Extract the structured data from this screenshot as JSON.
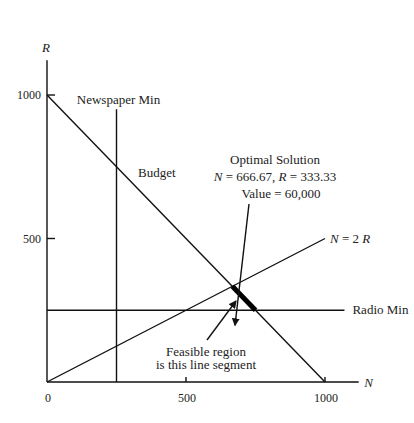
{
  "chart_data": {
    "type": "line",
    "title": "",
    "xlabel": "N",
    "ylabel": "R",
    "xlim": [
      0,
      1150
    ],
    "ylim": [
      0,
      1150
    ],
    "x_ticks": [
      0,
      500,
      1000
    ],
    "x_tick_labels": [
      "0",
      "500",
      "1000"
    ],
    "y_ticks": [
      500,
      1000
    ],
    "y_tick_labels": [
      "500",
      "1000"
    ],
    "grid": false,
    "lines": [
      {
        "name": "Budget",
        "label": "Budget",
        "points": [
          [
            0,
            1000
          ],
          [
            1000,
            0
          ]
        ]
      },
      {
        "name": "Newspaper Min",
        "label": "Newspaper Min",
        "points": [
          [
            250,
            0
          ],
          [
            250,
            950
          ]
        ]
      },
      {
        "name": "Radio Min",
        "label": "Radio Min",
        "points": [
          [
            0,
            250
          ],
          [
            1000,
            250
          ]
        ]
      },
      {
        "name": "N = 2R",
        "label_parts": [
          "N",
          " = 2 ",
          "R"
        ],
        "points": [
          [
            0,
            0
          ],
          [
            1000,
            500
          ]
        ]
      }
    ],
    "feasible_segment": {
      "points": [
        [
          666.67,
          333.33
        ],
        [
          750,
          250
        ]
      ],
      "label_lines": [
        "Feasible region",
        "is this line segment"
      ]
    },
    "optimal_solution": {
      "N": 666.67,
      "R": 333.33,
      "value": 60000,
      "label_lines": [
        "Optimal Solution",
        "N = 666.67, R = 333.33",
        "Value = 60,000"
      ],
      "title": "Optimal Solution",
      "n_text": "666.67",
      "r_text": "333.33",
      "value_text": "Value =  60,000"
    }
  }
}
